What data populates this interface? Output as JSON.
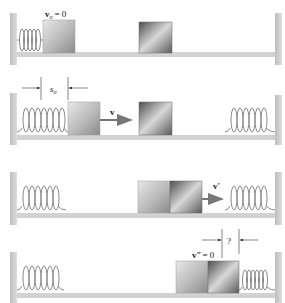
{
  "diagram": {
    "colors": {
      "wall": "#c8c8c8",
      "floor": "#d0d0d0",
      "spring": "#888888",
      "arrow": "#777777",
      "block_light_from": "#e6e6e6",
      "block_light_to": "#8f8f8f",
      "block_dark_from": "#5a5a5a",
      "block_dark_to": "#d8d8d8"
    },
    "panels": [
      {
        "stage": 1,
        "labels": {
          "velocity": "v",
          "velocity_sub": "o",
          "velocity_eq": "= 0"
        }
      },
      {
        "stage": 2,
        "labels": {
          "compression": "s",
          "compression_sub": "o",
          "velocity": "v"
        }
      },
      {
        "stage": 3,
        "labels": {
          "velocity": "v′"
        }
      },
      {
        "stage": 4,
        "labels": {
          "velocity": "v″",
          "velocity_eq": "= 0",
          "unknown": "?"
        }
      }
    ]
  }
}
